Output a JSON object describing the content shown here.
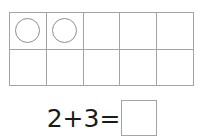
{
  "worksheet": {
    "ten_frame": {
      "name": "ten-frame",
      "columns": 5,
      "rows": 2,
      "total_cells": 10,
      "filled_count": 2,
      "cells": [
        {
          "index": 1,
          "row": 1,
          "column": 1,
          "filled": true,
          "counter": "circle-counter"
        },
        {
          "index": 2,
          "row": 1,
          "column": 2,
          "filled": true,
          "counter": "circle-counter"
        },
        {
          "index": 3,
          "row": 1,
          "column": 3,
          "filled": false,
          "counter": ""
        },
        {
          "index": 4,
          "row": 1,
          "column": 4,
          "filled": false,
          "counter": ""
        },
        {
          "index": 5,
          "row": 1,
          "column": 5,
          "filled": false,
          "counter": ""
        },
        {
          "index": 6,
          "row": 2,
          "column": 1,
          "filled": false,
          "counter": ""
        },
        {
          "index": 7,
          "row": 2,
          "column": 2,
          "filled": false,
          "counter": ""
        },
        {
          "index": 8,
          "row": 2,
          "column": 3,
          "filled": false,
          "counter": ""
        },
        {
          "index": 9,
          "row": 2,
          "column": 4,
          "filled": false,
          "counter": ""
        },
        {
          "index": 10,
          "row": 2,
          "column": 5,
          "filled": false,
          "counter": ""
        }
      ]
    },
    "equation": {
      "expression": "2+3=",
      "first_addend": "2",
      "operator": "+",
      "second_addend": "3",
      "equals": "=",
      "answer_value": ""
    },
    "colors": {
      "background": "#ffffff",
      "grid_line": "#a4a4a4",
      "counter_stroke": "#8f8f8f",
      "text": "#1a1a1a",
      "answer_box_border": "#a4a4a4"
    }
  }
}
